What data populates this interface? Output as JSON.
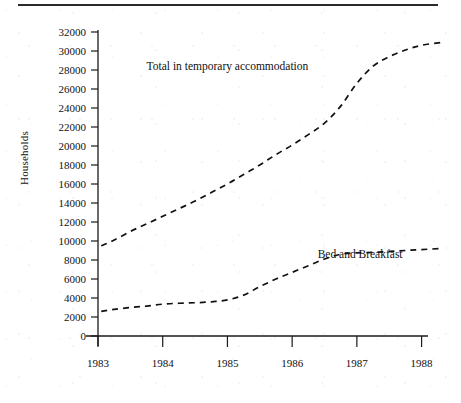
{
  "figure": {
    "top_rule": "horizontal-rule",
    "y_axis_title": "Households"
  },
  "chart_data": {
    "type": "line",
    "title": "",
    "xlabel": "",
    "ylabel": "Households",
    "xlim": [
      1983,
      1988.3
    ],
    "ylim": [
      0,
      32000
    ],
    "grid": false,
    "legend_position": "inline-annotations",
    "x_ticks": [
      "1983",
      "1984",
      "1985",
      "1986",
      "1987",
      "1988"
    ],
    "y_ticks": [
      "0",
      "2000",
      "4000",
      "6000",
      "8000",
      "10000",
      "12000",
      "14000",
      "16000",
      "18000",
      "20000",
      "22000",
      "24000",
      "26000",
      "28000",
      "30000",
      "32000"
    ],
    "y_tick_values": [
      0,
      2000,
      4000,
      6000,
      8000,
      10000,
      12000,
      14000,
      16000,
      18000,
      20000,
      22000,
      24000,
      26000,
      28000,
      30000,
      32000
    ],
    "line_style": "dashed",
    "annotations": [
      {
        "text": "Total in temporary accommodation",
        "x": 1985.0,
        "y": 28000
      },
      {
        "text": "Bed and Breakfast",
        "x": 1987.05,
        "y": 8200
      }
    ],
    "series": [
      {
        "name": "Total in temporary accommodation",
        "x": [
          1983.05,
          1983.25,
          1983.5,
          1983.75,
          1984.0,
          1984.25,
          1984.5,
          1984.75,
          1985.0,
          1985.25,
          1985.5,
          1985.75,
          1986.0,
          1986.25,
          1986.5,
          1986.75,
          1987.0,
          1987.25,
          1987.5,
          1987.75,
          1988.0,
          1988.3
        ],
        "values": [
          9500,
          10100,
          11000,
          11800,
          12600,
          13400,
          14200,
          15100,
          16000,
          17000,
          18000,
          19100,
          20100,
          21200,
          22400,
          24200,
          26600,
          28400,
          29400,
          30100,
          30600,
          30900
        ]
      },
      {
        "name": "Bed and Breakfast",
        "x": [
          1983.05,
          1983.25,
          1983.5,
          1983.75,
          1984.0,
          1984.25,
          1984.5,
          1984.75,
          1985.0,
          1985.25,
          1985.5,
          1985.75,
          1986.0,
          1986.25,
          1986.5,
          1986.75,
          1987.0,
          1987.25,
          1987.5,
          1987.75,
          1988.0,
          1988.3
        ],
        "values": [
          2600,
          2800,
          3000,
          3150,
          3350,
          3450,
          3500,
          3600,
          3800,
          4300,
          5200,
          6000,
          6700,
          7400,
          8100,
          8600,
          8750,
          8800,
          8900,
          9000,
          9100,
          9200
        ]
      }
    ]
  }
}
